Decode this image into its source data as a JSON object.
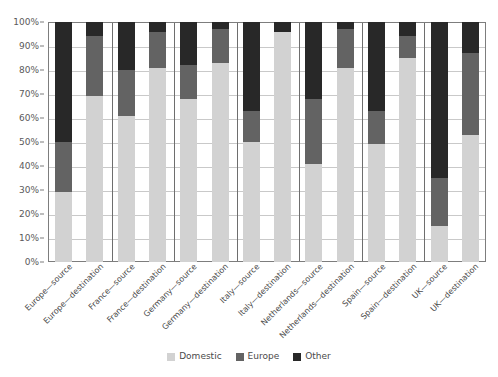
{
  "chart_data": {
    "type": "bar",
    "stacked": true,
    "stack_mode": "percent",
    "title": "",
    "subtitle": "",
    "xlabel": "",
    "ylabel": "",
    "ylim": [
      0,
      100
    ],
    "y_tick_labels": [
      "0%",
      "10%",
      "20%",
      "30%",
      "40%",
      "50%",
      "60%",
      "70%",
      "80%",
      "90%",
      "100%"
    ],
    "y_tick_values": [
      0,
      10,
      20,
      30,
      40,
      50,
      60,
      70,
      80,
      90,
      100
    ],
    "grid": "horizontal",
    "legend_position": "bottom-center",
    "categories": [
      "Europe—source",
      "Europe—destination",
      "France—source",
      "France—destination",
      "Germany—source",
      "Germany—destination",
      "Italy—source",
      "Italy—destination",
      "Netherlands—source",
      "Netherlands—destination",
      "Spain—source",
      "Spain—destination",
      "UK—source",
      "UK—destination"
    ],
    "group_separators_after": [
      1,
      3,
      5,
      7,
      9,
      11
    ],
    "series": [
      {
        "name": "Domestic",
        "color": "#d2d2d2",
        "values": [
          29,
          69,
          61,
          81,
          68,
          83,
          50,
          96,
          41,
          81,
          49,
          85,
          15,
          53
        ]
      },
      {
        "name": "Europe",
        "color": "#636363",
        "values": [
          21,
          25,
          19,
          15,
          14,
          14,
          13,
          0,
          27,
          16,
          14,
          9,
          20,
          34
        ]
      },
      {
        "name": "Other",
        "color": "#282828",
        "values": [
          50,
          6,
          20,
          4,
          18,
          3,
          37,
          4,
          32,
          3,
          37,
          6,
          65,
          13
        ]
      }
    ],
    "cumulative_tops": {
      "domestic": [
        29,
        69,
        61,
        81,
        68,
        83,
        50,
        96,
        41,
        81,
        49,
        85,
        15,
        53
      ],
      "europe": [
        50,
        94,
        80,
        96,
        82,
        97,
        63,
        96,
        68,
        97,
        63,
        94,
        35,
        87
      ],
      "other": [
        100,
        100,
        100,
        100,
        100,
        100,
        100,
        100,
        100,
        100,
        100,
        100,
        100,
        100
      ]
    }
  },
  "legend": {
    "items": [
      {
        "label": "Domestic",
        "color": "#d2d2d2",
        "swatch_name": "legend-swatch-domestic"
      },
      {
        "label": "Europe",
        "color": "#636363",
        "swatch_name": "legend-swatch-europe"
      },
      {
        "label": "Other",
        "color": "#282828",
        "swatch_name": "legend-swatch-other"
      }
    ]
  },
  "colors": {
    "domestic": "#d2d2d2",
    "europe": "#636363",
    "other": "#282828",
    "gridline": "#c9c9c9",
    "axis": "#7d7d7d",
    "group_separator": "#6e6e6e",
    "text": "#4a4a4a",
    "background": "#ffffff"
  }
}
